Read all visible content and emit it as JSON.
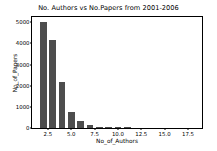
{
  "chart_data": {
    "type": "bar",
    "title": "No. Authors vs No.Papers from 2001-2006",
    "xlabel": "No_of_Authors",
    "ylabel": "No_of_Papers",
    "grid": false,
    "legend": null,
    "bar_color": "#4d4d4d",
    "xlim": [
      0.8,
      19.0
    ],
    "ylim": [
      0,
      5250
    ],
    "xticks": [
      "2.5",
      "5.0",
      "7.5",
      "10.0",
      "12.5",
      "15.0",
      "17.5"
    ],
    "xtick_values": [
      2.5,
      5.0,
      7.5,
      10.0,
      12.5,
      15.0,
      17.5
    ],
    "yticks": [
      "0",
      "1000",
      "2000",
      "3000",
      "4000",
      "5000"
    ],
    "ytick_values": [
      0,
      1000,
      2000,
      3000,
      4000,
      5000
    ],
    "x": [
      2,
      3,
      4,
      5,
      6,
      7,
      8,
      9,
      10,
      11
    ],
    "categories": [
      "2",
      "3",
      "4",
      "5",
      "6",
      "7",
      "8",
      "9",
      "10",
      "11"
    ],
    "values": [
      5000,
      4150,
      2180,
      770,
      310,
      120,
      55,
      30,
      18,
      10
    ],
    "bar_width": 0.72
  },
  "figure": {
    "background_color": "#ffffff",
    "axes_edge_color": "#000000",
    "text_color": "#000000"
  }
}
